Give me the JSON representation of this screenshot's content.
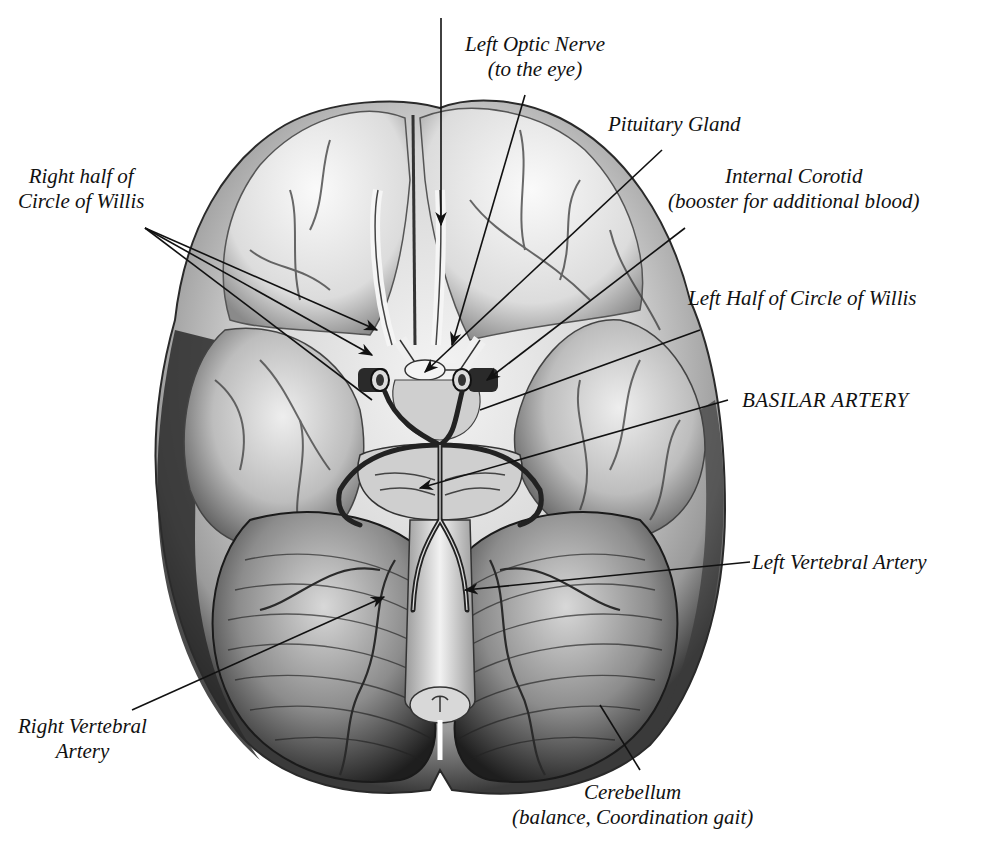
{
  "diagram": {
    "colors": {
      "background": "#ffffff",
      "ink": "#111111",
      "brain_light": "#e8e8e8",
      "brain_mid": "#b8b8b8",
      "brain_dark": "#5a5a5a",
      "artery": "#2a2a2a"
    },
    "labels": [
      {
        "id": "left-optic-nerve",
        "lines": [
          "Left Optic Nerve",
          "(to the eye)"
        ]
      },
      {
        "id": "pituitary-gland",
        "lines": [
          "Pituitary Gland"
        ]
      },
      {
        "id": "internal-carotid",
        "lines": [
          "Internal Corotid",
          "(booster for additional blood)"
        ]
      },
      {
        "id": "right-half-circle-of-willis",
        "lines": [
          "Right half of",
          "Circle of Willis"
        ]
      },
      {
        "id": "left-half-circle-of-willis",
        "lines": [
          "Left Half of Circle of Willis"
        ]
      },
      {
        "id": "basilar-artery",
        "lines": [
          "BASILAR ARTERY"
        ]
      },
      {
        "id": "left-vertebral-artery",
        "lines": [
          "Left Vertebral Artery"
        ]
      },
      {
        "id": "right-vertebral-artery",
        "lines": [
          "Right Vertebral",
          "Artery"
        ]
      },
      {
        "id": "cerebellum",
        "lines": [
          "Cerebellum",
          "(balance, Coordination gait)"
        ]
      }
    ]
  }
}
